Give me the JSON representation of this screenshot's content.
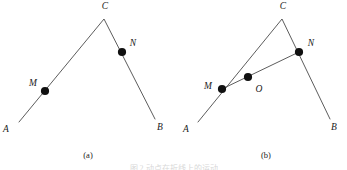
{
  "figure": {
    "background_color": "#ffffff",
    "line_color": "#4a4a4a",
    "dot_color": "#101010",
    "label_color": "#1a1a1a",
    "bottom_caption": "图 2 动点在折线上的运动",
    "panels": [
      {
        "id": "a",
        "caption": "(a)",
        "caption_x": 88,
        "caption_y": 158,
        "path_points": "19,122 104,19 155,119",
        "has_chord": false,
        "chord_points": "",
        "vertices": [
          {
            "name": "A",
            "label": "A",
            "x": 19,
            "y": 122,
            "label_x": 6,
            "label_y": 130,
            "dot": false
          },
          {
            "name": "M",
            "label": "M",
            "x": 45,
            "y": 91,
            "label_x": 33,
            "label_y": 84,
            "dot": true
          },
          {
            "name": "C",
            "label": "C",
            "x": 104,
            "y": 19,
            "label_x": 105,
            "label_y": 7,
            "dot": false
          },
          {
            "name": "N",
            "label": "N",
            "x": 122,
            "y": 52,
            "label_x": 133,
            "label_y": 44,
            "dot": true
          },
          {
            "name": "B",
            "label": "B",
            "x": 155,
            "y": 119,
            "label_x": 160,
            "label_y": 128,
            "dot": false
          }
        ]
      },
      {
        "id": "b",
        "caption": "(b)",
        "caption_x": 266,
        "caption_y": 158,
        "path_points": "198,122 282,19 330,119",
        "has_chord": true,
        "chord_points": "222,89 299,52",
        "vertices": [
          {
            "name": "A",
            "label": "A",
            "x": 198,
            "y": 122,
            "label_x": 186,
            "label_y": 130,
            "dot": false
          },
          {
            "name": "M",
            "label": "M",
            "x": 222,
            "y": 89,
            "label_x": 208,
            "label_y": 87,
            "dot": true
          },
          {
            "name": "O",
            "label": "O",
            "x": 248,
            "y": 77,
            "label_x": 259,
            "label_y": 90,
            "dot": true
          },
          {
            "name": "C",
            "label": "C",
            "x": 282,
            "y": 19,
            "label_x": 283,
            "label_y": 7,
            "dot": false
          },
          {
            "name": "N",
            "label": "N",
            "x": 299,
            "y": 52,
            "label_x": 311,
            "label_y": 44,
            "dot": true
          },
          {
            "name": "B",
            "label": "B",
            "x": 330,
            "y": 119,
            "label_x": 334,
            "label_y": 128,
            "dot": false
          }
        ]
      }
    ]
  }
}
